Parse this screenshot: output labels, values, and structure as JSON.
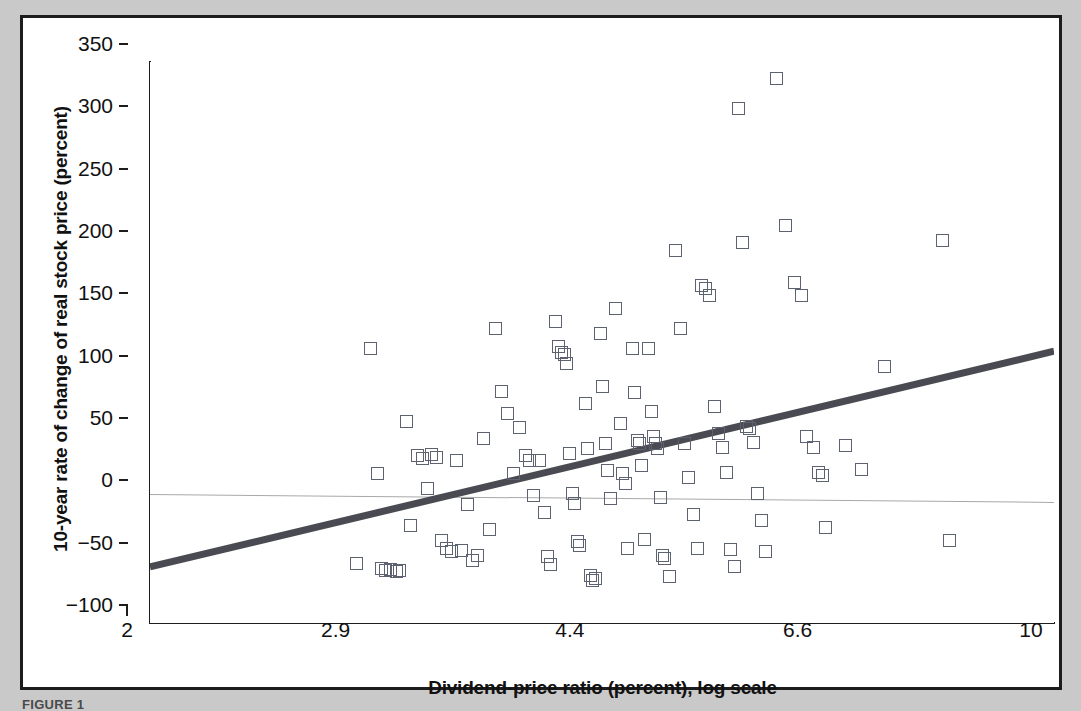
{
  "figure": {
    "caption": "FIGURE 1",
    "background_color": "#c9c9c9",
    "panel_color": "#ffffff",
    "frame_color": "#1c1c1c"
  },
  "chart_data": {
    "type": "scatter",
    "title": "",
    "subtitle": "",
    "xlabel": "Dividend-price ratio (percent), log scale",
    "ylabel": "10-year rate of change of real stock price (percent)",
    "xscale": "log",
    "yscale": "linear",
    "xlim": [
      2,
      10
    ],
    "ylim": [
      -100,
      350
    ],
    "xticks": [
      2,
      2.9,
      4.4,
      6.6,
      10
    ],
    "xtick_labels": [
      "2",
      "2.9",
      "4.4",
      "6.6",
      "10"
    ],
    "yticks": [
      -100,
      -50,
      0,
      50,
      100,
      150,
      200,
      250,
      300,
      350
    ],
    "ytick_labels": [
      "−100",
      "−50",
      "0",
      "50",
      "100",
      "150",
      "200",
      "250",
      "300",
      "350"
    ],
    "grid": false,
    "legend": "none",
    "marker": {
      "shape": "open-square",
      "size_px": 13,
      "edge_color": "#5c6270",
      "face_color": "none"
    },
    "reference_lines": [
      {
        "name": "zero-line",
        "orientation": "horizontal",
        "y": 0,
        "color": "#a8a8a8",
        "width_px": 1,
        "note": "drawn with slight downward tilt in the original artwork"
      }
    ],
    "trendline": {
      "name": "regression-line",
      "type": "linear-fit-on-log-x",
      "color": "#4a4a52",
      "width_px": 7,
      "x_start": 2,
      "y_start": -55,
      "x_end": 10,
      "y_end": 118
    },
    "series": [
      {
        "name": "observations",
        "points": [
          [
            2.89,
            -52
          ],
          [
            2.96,
            120
          ],
          [
            3.0,
            20
          ],
          [
            3.02,
            -56
          ],
          [
            3.04,
            -58
          ],
          [
            3.07,
            -57
          ],
          [
            3.1,
            -59
          ],
          [
            3.12,
            -58
          ],
          [
            3.16,
            62
          ],
          [
            3.18,
            -22
          ],
          [
            3.22,
            34
          ],
          [
            3.25,
            32
          ],
          [
            3.28,
            8
          ],
          [
            3.3,
            35
          ],
          [
            3.33,
            33
          ],
          [
            3.36,
            -34
          ],
          [
            3.39,
            -40
          ],
          [
            3.42,
            -43
          ],
          [
            3.45,
            30
          ],
          [
            3.48,
            -42
          ],
          [
            3.52,
            -5
          ],
          [
            3.55,
            -50
          ],
          [
            3.58,
            -46
          ],
          [
            3.62,
            48
          ],
          [
            3.66,
            -25
          ],
          [
            3.7,
            136
          ],
          [
            3.74,
            86
          ],
          [
            3.78,
            68
          ],
          [
            3.82,
            20
          ],
          [
            3.86,
            57
          ],
          [
            3.9,
            34
          ],
          [
            3.93,
            30
          ],
          [
            3.96,
            2
          ],
          [
            4.0,
            30
          ],
          [
            4.04,
            -11
          ],
          [
            4.06,
            -47
          ],
          [
            4.08,
            -53
          ],
          [
            4.12,
            142
          ],
          [
            4.14,
            122
          ],
          [
            4.16,
            117
          ],
          [
            4.18,
            115
          ],
          [
            4.2,
            108
          ],
          [
            4.22,
            36
          ],
          [
            4.24,
            4
          ],
          [
            4.26,
            -4
          ],
          [
            4.28,
            -35
          ],
          [
            4.3,
            -38
          ],
          [
            4.34,
            76
          ],
          [
            4.36,
            40
          ],
          [
            4.38,
            -62
          ],
          [
            4.4,
            -66
          ],
          [
            4.42,
            -64
          ],
          [
            4.46,
            132
          ],
          [
            4.48,
            90
          ],
          [
            4.5,
            44
          ],
          [
            4.52,
            22
          ],
          [
            4.54,
            0
          ],
          [
            4.58,
            152
          ],
          [
            4.62,
            60
          ],
          [
            4.64,
            20
          ],
          [
            4.66,
            12
          ],
          [
            4.68,
            -40
          ],
          [
            4.72,
            120
          ],
          [
            4.74,
            85
          ],
          [
            4.76,
            46
          ],
          [
            4.78,
            44
          ],
          [
            4.8,
            26
          ],
          [
            4.82,
            -33
          ],
          [
            4.86,
            120
          ],
          [
            4.88,
            70
          ],
          [
            4.9,
            50
          ],
          [
            4.92,
            44
          ],
          [
            4.94,
            40
          ],
          [
            4.96,
            1
          ],
          [
            4.98,
            -46
          ],
          [
            5.0,
            -48
          ],
          [
            5.04,
            -63
          ],
          [
            5.1,
            199
          ],
          [
            5.14,
            136
          ],
          [
            5.18,
            44
          ],
          [
            5.22,
            17
          ],
          [
            5.26,
            -13
          ],
          [
            5.3,
            -40
          ],
          [
            5.34,
            171
          ],
          [
            5.38,
            168
          ],
          [
            5.42,
            163
          ],
          [
            5.46,
            74
          ],
          [
            5.5,
            52
          ],
          [
            5.54,
            41
          ],
          [
            5.58,
            21
          ],
          [
            5.62,
            -41
          ],
          [
            5.66,
            -55
          ],
          [
            5.7,
            313
          ],
          [
            5.74,
            205
          ],
          [
            5.78,
            58
          ],
          [
            5.82,
            56
          ],
          [
            5.86,
            45
          ],
          [
            5.9,
            4
          ],
          [
            5.94,
            -18
          ],
          [
            5.98,
            -43
          ],
          [
            6.1,
            337
          ],
          [
            6.2,
            219
          ],
          [
            6.3,
            173
          ],
          [
            6.38,
            163
          ],
          [
            6.44,
            50
          ],
          [
            6.52,
            41
          ],
          [
            6.58,
            21
          ],
          [
            6.62,
            18
          ],
          [
            6.66,
            -23
          ],
          [
            6.9,
            42
          ],
          [
            7.1,
            23
          ],
          [
            7.4,
            106
          ],
          [
            8.2,
            207
          ],
          [
            8.3,
            -34
          ]
        ]
      }
    ]
  }
}
